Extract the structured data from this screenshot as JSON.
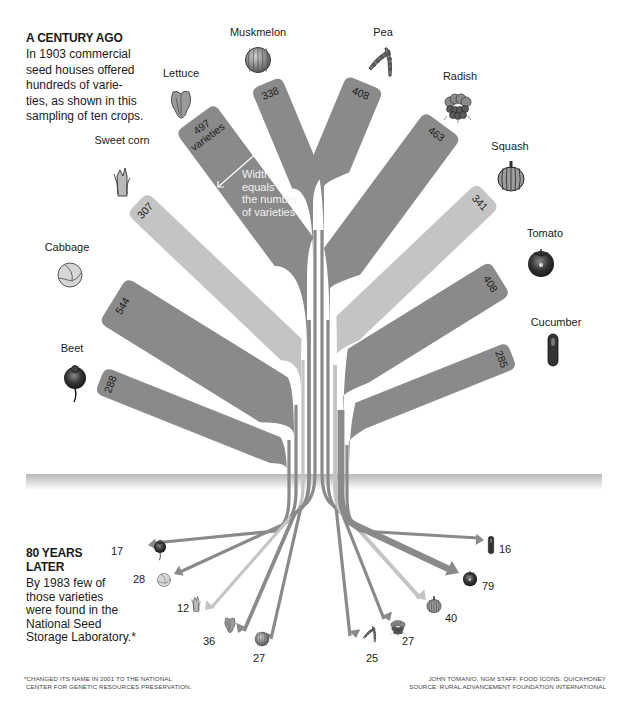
{
  "intro": {
    "heading": "A CENTURY AGO",
    "lines": [
      "In 1903 commercial",
      "seed houses offered",
      "hundreds of varie-",
      "ties, as shown in this",
      "sampling of ten crops."
    ]
  },
  "later": {
    "heading_lines": [
      "80 YEARS",
      "LATER"
    ],
    "lines": [
      "By 1983 few of",
      "those varieties",
      "were found in the",
      "National Seed",
      "Storage Laboratory.*"
    ]
  },
  "legend_note": {
    "lines": [
      "Width",
      "equals",
      "the number",
      "of varieties"
    ],
    "varieties_label": "varieties"
  },
  "footnote": {
    "left": [
      "*CHANGED ITS NAME IN 2001 TO THE NATIONAL",
      "CENTER FOR GENETIC RESOURCES PRESERVATION."
    ],
    "right": [
      "JOHN TOMANIO, NGM STAFF. FOOD ICONS: QUICKHONEY",
      "SOURCE: RURAL ADVANCEMENT FOUNDATION INTERNATIONAL"
    ]
  },
  "colors": {
    "dark_band": "#8a8a8a",
    "light_band": "#c4c4c4",
    "horizon_top": "#bdbdbd",
    "horizon_bottom": "#ffffff"
  },
  "chart_data": {
    "type": "flow",
    "subtitle": "Varieties offered by commercial seed houses in 1903 vs. varieties found in the National Seed Storage Laboratory in 1983",
    "categories": [
      "Beet",
      "Cabbage",
      "Sweet corn",
      "Lettuce",
      "Muskmelon",
      "Pea",
      "Radish",
      "Squash",
      "Tomato",
      "Cucumber"
    ],
    "series": [
      {
        "name": "1903 varieties",
        "values": [
          288,
          544,
          307,
          497,
          338,
          408,
          463,
          341,
          408,
          285
        ]
      },
      {
        "name": "1983 varieties",
        "values": [
          17,
          28,
          12,
          36,
          27,
          25,
          27,
          40,
          79,
          16
        ]
      }
    ],
    "annotations": [
      "Width equals the number of varieties"
    ]
  },
  "crops": [
    {
      "name": "Beet",
      "y1903": 288,
      "y1983": 17,
      "shade": "dark"
    },
    {
      "name": "Cabbage",
      "y1903": 544,
      "y1983": 28,
      "shade": "dark"
    },
    {
      "name": "Sweet corn",
      "y1903": 307,
      "y1983": 12,
      "shade": "light"
    },
    {
      "name": "Lettuce",
      "y1903": 497,
      "y1983": 36,
      "shade": "dark"
    },
    {
      "name": "Muskmelon",
      "y1903": 338,
      "y1983": 27,
      "shade": "dark"
    },
    {
      "name": "Pea",
      "y1903": 408,
      "y1983": 25,
      "shade": "dark"
    },
    {
      "name": "Radish",
      "y1903": 463,
      "y1983": 27,
      "shade": "dark"
    },
    {
      "name": "Squash",
      "y1903": 341,
      "y1983": 40,
      "shade": "light"
    },
    {
      "name": "Tomato",
      "y1903": 408,
      "y1983": 79,
      "shade": "dark"
    },
    {
      "name": "Cucumber",
      "y1903": 285,
      "y1983": 16,
      "shade": "dark"
    }
  ]
}
